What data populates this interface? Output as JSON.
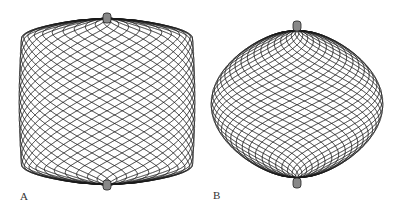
{
  "figure": {
    "panels": [
      {
        "label": "A",
        "shape": "barrel-cylindrical",
        "description": "wire mesh basket with flattened ends"
      },
      {
        "label": "B",
        "shape": "spherical",
        "description": "wire mesh sphere"
      }
    ],
    "line_color": "#1a1a1a",
    "background": "#ffffff"
  }
}
